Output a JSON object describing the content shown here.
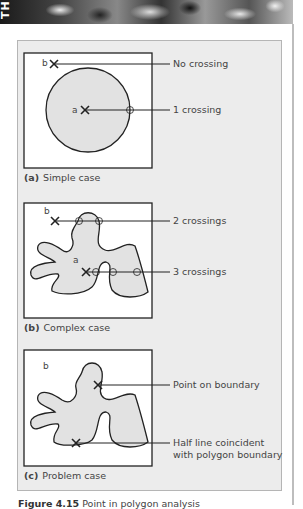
{
  "header": {
    "running_title_fragment": "TH"
  },
  "figure": {
    "panels": [
      {
        "id": "a",
        "tag": "(a)",
        "title": "Simple case",
        "points": [
          {
            "label": "b"
          },
          {
            "label": "a"
          }
        ],
        "callouts": [
          "No crossing",
          "1 crossing"
        ]
      },
      {
        "id": "b",
        "tag": "(b)",
        "title": "Complex case",
        "points": [
          {
            "label": "b"
          },
          {
            "label": "a"
          }
        ],
        "callouts": [
          "2 crossings",
          "3 crossings"
        ]
      },
      {
        "id": "c",
        "tag": "(c)",
        "title": "Problem case",
        "points": [
          {
            "label": "b"
          }
        ],
        "callouts": [
          "Point on boundary",
          "Half line coincident",
          "with polygon boundary"
        ]
      }
    ],
    "caption": {
      "number": "Figure 4.15",
      "text": "Point in polygon analysis"
    }
  },
  "colors": {
    "panel_bg": "#ececec",
    "polygon_fill": "#e2e2e2",
    "stroke": "#222222"
  }
}
